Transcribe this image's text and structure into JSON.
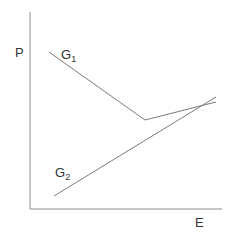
{
  "diagram": {
    "axes": {
      "y_label": "P",
      "x_label": "E"
    },
    "curves": [
      {
        "name": "G1",
        "label_main": "G",
        "label_sub": "1",
        "description": "Decreasing line from upper-left, then kinks upward to the right",
        "points": [
          [
            49,
            52
          ],
          [
            145,
            120
          ],
          [
            216,
            102
          ]
        ]
      },
      {
        "name": "G2",
        "label_main": "G",
        "label_sub": "2",
        "description": "Increasing straight line from lower-left to upper-right",
        "points": [
          [
            54,
            196
          ],
          [
            216,
            97
          ]
        ]
      }
    ],
    "colors": {
      "axis": "#8a8a8a",
      "line": "#7a7a7a",
      "text": "#333333"
    }
  }
}
